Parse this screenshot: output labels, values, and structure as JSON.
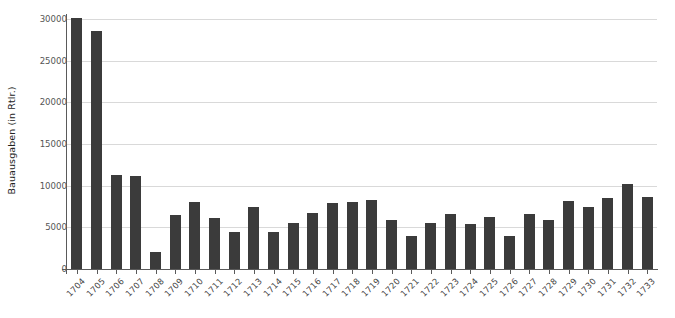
{
  "chart_data": {
    "type": "bar",
    "title": "",
    "xlabel": "",
    "ylabel": "Bauausgaben (in Rtlr.)",
    "categories": [
      "1704",
      "1705",
      "1706",
      "1707",
      "1708",
      "1709",
      "1710",
      "1711",
      "1712",
      "1713",
      "1714",
      "1715",
      "1716",
      "1717",
      "1718",
      "1719",
      "1720",
      "1721",
      "1722",
      "1723",
      "1724",
      "1725",
      "1726",
      "1727",
      "1728",
      "1729",
      "1730",
      "1731",
      "1732",
      "1733"
    ],
    "values": [
      30100,
      28600,
      11300,
      11150,
      2100,
      6500,
      8000,
      6100,
      4500,
      7400,
      4500,
      5500,
      6700,
      7900,
      8100,
      8300,
      5900,
      3950,
      5500,
      6600,
      5400,
      6200,
      3950,
      6600,
      5900,
      8200,
      7500,
      8500,
      10200,
      8600
    ],
    "ylim": [
      0,
      30000
    ],
    "yticks": [
      0,
      5000,
      10000,
      15000,
      20000,
      25000,
      30000
    ],
    "ytick_labels": [
      "0",
      "5000",
      "10000",
      "15000",
      "20000",
      "25000",
      "30000"
    ],
    "grid": true,
    "legend": false,
    "bar_color": "#3b3b3b",
    "grid_color": "#d9d9d9",
    "axis_color": "#5a5a5a"
  }
}
